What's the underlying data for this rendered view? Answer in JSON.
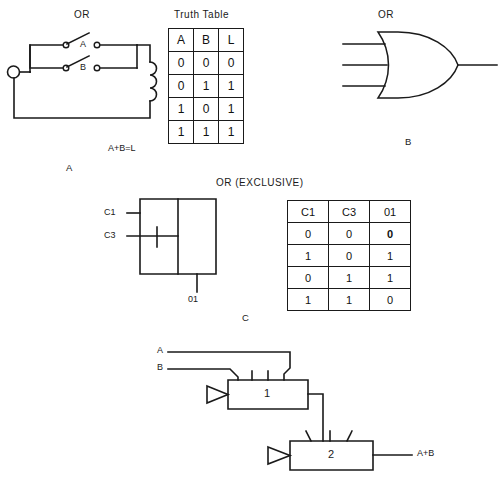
{
  "figure": {
    "panels": [
      {
        "id": "A",
        "id_label": "A",
        "heading": "OR",
        "equation": "A+B=L",
        "switch_labels": [
          "A",
          "B"
        ],
        "description": "Parallel switch contacts A and B in series with a relay coil and source"
      },
      {
        "id": "B",
        "id_label": "B",
        "heading": "OR",
        "description": "Distinctive-shape OR gate symbol with three inputs and one output"
      },
      {
        "id": "C",
        "id_label": "C",
        "heading": "OR (EXCLUSIVE)",
        "input_labels": [
          "C1",
          "C3"
        ],
        "output_label": "01",
        "description": "Rectangular exclusive-OR block with inputs C1 and C3 and output 01"
      },
      {
        "id": "D",
        "inputs": [
          "A",
          "B"
        ],
        "gate_labels": [
          "1",
          "2"
        ],
        "output_label": "A+B",
        "description": "Two cascaded amplifier/gate blocks numbered 1 and 2 producing A+B"
      }
    ],
    "tables": [
      {
        "name": "truth-table-or",
        "caption": "Truth Table",
        "headers": [
          "A",
          "B",
          "L"
        ],
        "rows": [
          [
            "0",
            "0",
            "0"
          ],
          [
            "0",
            "1",
            "1"
          ],
          [
            "1",
            "0",
            "1"
          ],
          [
            "1",
            "1",
            "1"
          ]
        ]
      },
      {
        "name": "truth-table-xor",
        "caption": "",
        "headers": [
          "C1",
          "C3",
          "01"
        ],
        "rows": [
          [
            "0",
            "0",
            "0"
          ],
          [
            "1",
            "0",
            "1"
          ],
          [
            "0",
            "1",
            "1"
          ],
          [
            "1",
            "1",
            "0"
          ]
        ],
        "emphasis": {
          "row": 0,
          "col": 2
        }
      }
    ],
    "colors": {
      "ink": "#1a1a1a",
      "paper": "#ffffff"
    }
  }
}
